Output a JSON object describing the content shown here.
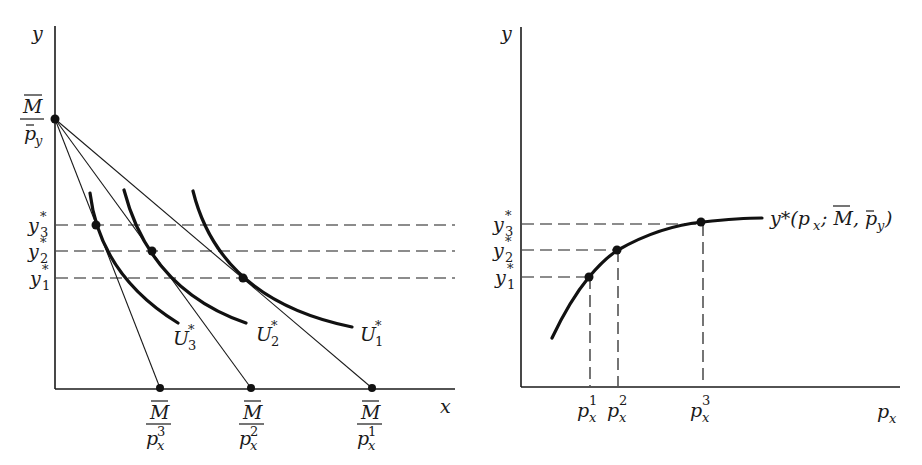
{
  "left_panel": {
    "y_axis_label": "y",
    "x_axis_label": "x",
    "intercept_label": {
      "numerator": "M",
      "denominator": "p",
      "denominator_sub": "y"
    },
    "y_ticks": [
      {
        "base": "y",
        "sup": "*",
        "sub": "3"
      },
      {
        "base": "y",
        "sup": "*",
        "sub": "2"
      },
      {
        "base": "y",
        "sup": "*",
        "sub": "1"
      }
    ],
    "x_ticks": [
      {
        "numerator": "M",
        "denominator": "p",
        "denominator_sub": "x",
        "denominator_sup": "3"
      },
      {
        "numerator": "M",
        "denominator": "p",
        "denominator_sub": "x",
        "denominator_sup": "2"
      },
      {
        "numerator": "M",
        "denominator": "p",
        "denominator_sub": "x",
        "denominator_sup": "1"
      }
    ],
    "indifference_curves": [
      {
        "base": "U",
        "sup": "*",
        "sub": "3"
      },
      {
        "base": "U",
        "sup": "*",
        "sub": "2"
      },
      {
        "base": "U",
        "sup": "*",
        "sub": "1"
      }
    ]
  },
  "right_panel": {
    "y_axis_label": "y",
    "x_axis_label": {
      "base": "p",
      "sub": "x"
    },
    "y_ticks": [
      {
        "base": "y",
        "sup": "*",
        "sub": "3"
      },
      {
        "base": "y",
        "sup": "*",
        "sub": "2"
      },
      {
        "base": "y",
        "sup": "*",
        "sub": "1"
      }
    ],
    "x_ticks": [
      {
        "base": "p",
        "sub": "x",
        "sup": "1"
      },
      {
        "base": "p",
        "sub": "x",
        "sup": "2"
      },
      {
        "base": "p",
        "sub": "x",
        "sup": "3"
      }
    ],
    "curve_label": {
      "prefix": "y*(p",
      "prefix_sub": "x",
      "mid": "; M, p",
      "mid_sub": "y",
      "suffix": ")"
    }
  }
}
